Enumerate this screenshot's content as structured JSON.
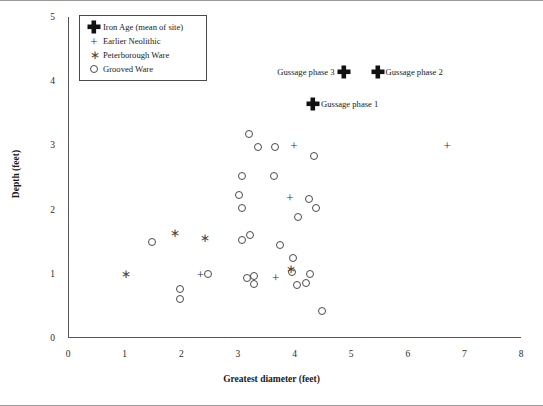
{
  "chart_data": {
    "type": "scatter",
    "title": "",
    "xlabel": "Greatest diameter (feet)",
    "ylabel": "Depth (feet)",
    "xlim": [
      0,
      8
    ],
    "ylim": [
      0,
      5
    ],
    "xticks": [
      "0",
      "1",
      "2",
      "3",
      "4",
      "5",
      "6",
      "7",
      "8"
    ],
    "yticks": [
      "0",
      "1",
      "2",
      "3",
      "4",
      "5"
    ],
    "grid": false,
    "legend_position": "top-left",
    "series": [
      {
        "name": "Iron Age (mean of site)",
        "marker": "fat-cross",
        "points": [
          {
            "x": 4.85,
            "y": 4.15,
            "label": "Gussage phase 3",
            "label_side": "left"
          },
          {
            "x": 5.45,
            "y": 4.15,
            "label": "Gussage phase 2",
            "label_side": "right"
          },
          {
            "x": 4.31,
            "y": 3.65,
            "label": "Gussage phase 1",
            "label_side": "right"
          }
        ]
      },
      {
        "name": "Earlier Neolithic",
        "marker": "plus",
        "points": [
          {
            "x": 3.97,
            "y": 3.0
          },
          {
            "x": 6.68,
            "y": 3.0
          },
          {
            "x": 3.9,
            "y": 2.2
          },
          {
            "x": 2.32,
            "y": 1.0
          },
          {
            "x": 3.65,
            "y": 0.95
          }
        ]
      },
      {
        "name": "Peterborough Ware",
        "marker": "asterisk",
        "points": [
          {
            "x": 1.86,
            "y": 1.63
          },
          {
            "x": 2.39,
            "y": 1.55
          },
          {
            "x": 1.0,
            "y": 1.0
          },
          {
            "x": 3.92,
            "y": 1.08
          }
        ]
      },
      {
        "name": "Grooved Ware",
        "marker": "circle",
        "points": [
          {
            "x": 3.17,
            "y": 3.17
          },
          {
            "x": 3.34,
            "y": 2.97
          },
          {
            "x": 3.63,
            "y": 2.98
          },
          {
            "x": 4.32,
            "y": 2.83
          },
          {
            "x": 3.05,
            "y": 2.53
          },
          {
            "x": 3.62,
            "y": 2.52
          },
          {
            "x": 3.0,
            "y": 2.23
          },
          {
            "x": 4.23,
            "y": 2.16
          },
          {
            "x": 3.05,
            "y": 2.02
          },
          {
            "x": 4.36,
            "y": 2.03
          },
          {
            "x": 4.05,
            "y": 1.89
          },
          {
            "x": 3.2,
            "y": 1.6
          },
          {
            "x": 3.06,
            "y": 1.52
          },
          {
            "x": 1.46,
            "y": 1.5
          },
          {
            "x": 3.73,
            "y": 1.45
          },
          {
            "x": 3.95,
            "y": 1.24
          },
          {
            "x": 2.45,
            "y": 1.0
          },
          {
            "x": 4.25,
            "y": 1.0
          },
          {
            "x": 3.93,
            "y": 1.03
          },
          {
            "x": 3.14,
            "y": 0.93
          },
          {
            "x": 3.26,
            "y": 0.96
          },
          {
            "x": 3.26,
            "y": 0.84
          },
          {
            "x": 4.03,
            "y": 0.83
          },
          {
            "x": 4.18,
            "y": 0.86
          },
          {
            "x": 1.96,
            "y": 0.76
          },
          {
            "x": 1.96,
            "y": 0.6
          },
          {
            "x": 4.46,
            "y": 0.42
          }
        ]
      }
    ]
  },
  "legend": {
    "items": [
      {
        "label": "Iron Age (mean of site)",
        "marker": "fat-cross"
      },
      {
        "label": "Earlier Neolithic",
        "marker": "plus"
      },
      {
        "label": "Peterborough Ware",
        "marker": "asterisk"
      },
      {
        "label": "Grooved Ware",
        "marker": "circle"
      }
    ]
  },
  "colors": {
    "marker_outline": "#4a4a4a",
    "iron_age": "#111111",
    "axis": "#555555",
    "text": "#1a1a1a"
  }
}
